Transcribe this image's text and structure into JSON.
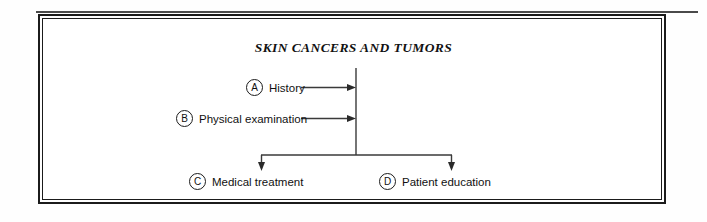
{
  "document": {
    "title": "SKIN CANCERS AND TUMORS"
  },
  "diagram": {
    "type": "flowchart",
    "orientation": "inputs-left-to-vertical-spine-then-split-down",
    "inputs": [
      {
        "badge": "A",
        "label": "History"
      },
      {
        "badge": "B",
        "label": "Physical examination"
      }
    ],
    "outputs": [
      {
        "badge": "C",
        "label": "Medical treatment"
      },
      {
        "badge": "D",
        "label": "Patient education"
      }
    ],
    "connectors": {
      "spine_label": "vertical-spine",
      "split_label": "horizontal-distribution-bar"
    }
  },
  "colors": {
    "ink": "#111111",
    "line": "#3a3a3a",
    "frame": "#1b1b1b",
    "page": "#ffffff"
  }
}
